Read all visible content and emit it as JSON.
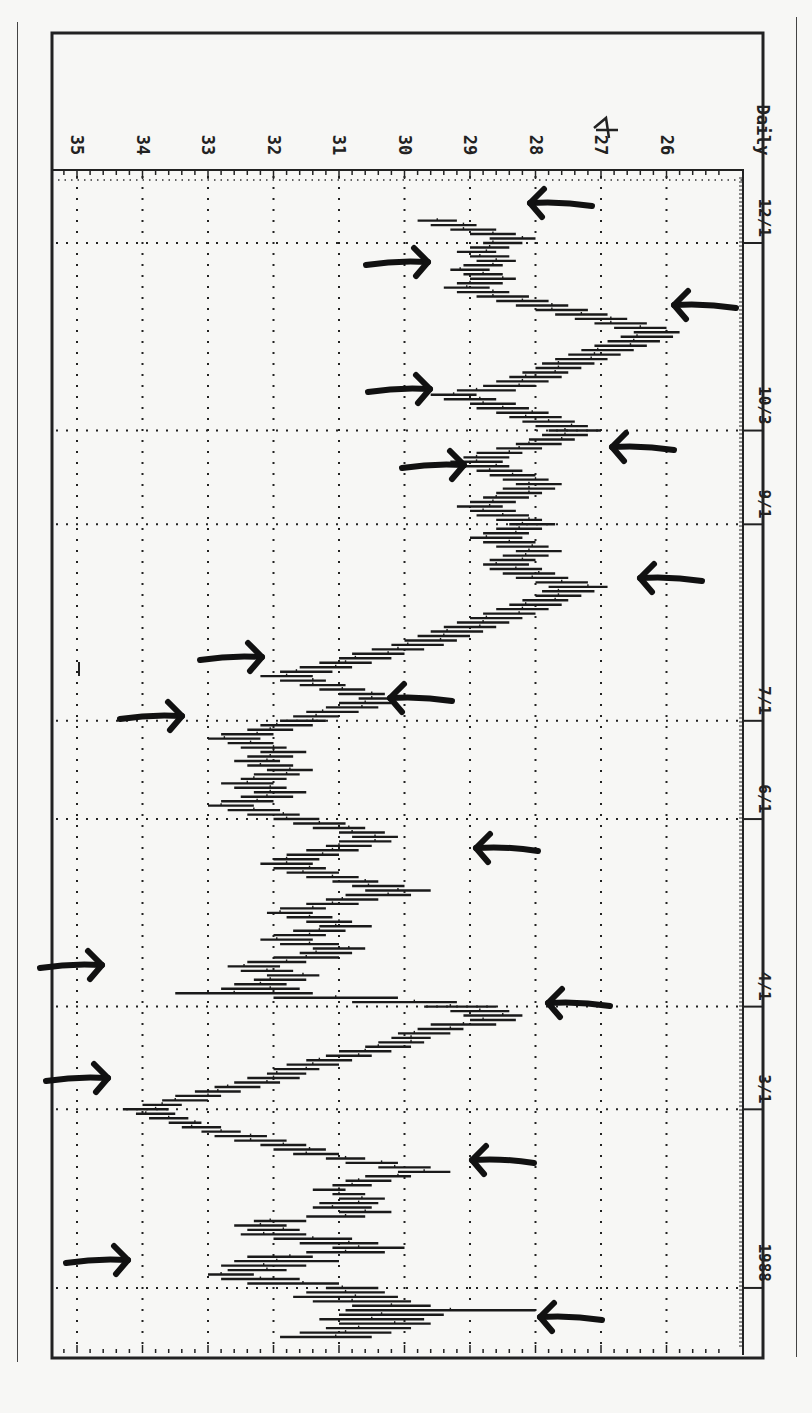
{
  "chart_data": {
    "type": "bar",
    "subtype": "ohlc-range-bars (rotated 90deg clockwise)",
    "title": "",
    "period_label": "Daily",
    "year_label": "1988",
    "ylabel": "Price",
    "xlabel": "Date",
    "price_ticks": [
      35,
      34,
      33,
      32,
      31,
      30,
      29,
      28,
      27,
      26
    ],
    "price_range": [
      25.3,
      35.3
    ],
    "date_ticks": [
      {
        "label": "1988",
        "row": 13
      },
      {
        "label": "3/1",
        "row": 53
      },
      {
        "label": "4/1",
        "row": 76
      },
      {
        "label": "6/1",
        "row": 118
      },
      {
        "label": "7/1",
        "row": 140
      },
      {
        "label": "9/1",
        "row": 184
      },
      {
        "label": "10/3",
        "row": 205
      },
      {
        "label": "12/1",
        "row": 247
      }
    ],
    "grid": true,
    "annotations": "Hand-drawn arrows marking swing highs and lows; handwritten '4' correction over the 27 tick label",
    "bars": [
      [
        30.5,
        31.9
      ],
      [
        30.2,
        31.6
      ],
      [
        29.9,
        31.2
      ],
      [
        29.6,
        31.0
      ],
      [
        29.7,
        31.3
      ],
      [
        29.4,
        31.0
      ],
      [
        28.0,
        30.9
      ],
      [
        29.6,
        30.8
      ],
      [
        29.9,
        31.4
      ],
      [
        30.1,
        31.7
      ],
      [
        30.3,
        31.5
      ],
      [
        30.4,
        31.2
      ],
      [
        31.0,
        32.4
      ],
      [
        31.6,
        32.8
      ],
      [
        32.3,
        33.0
      ],
      [
        31.8,
        32.7
      ],
      [
        31.5,
        32.8
      ],
      [
        31.0,
        32.6
      ],
      [
        31.4,
        32.4
      ],
      [
        30.3,
        31.5
      ],
      [
        30.0,
        31.1
      ],
      [
        30.4,
        31.6
      ],
      [
        30.8,
        32.0
      ],
      [
        31.5,
        32.5
      ],
      [
        31.6,
        32.4
      ],
      [
        31.8,
        32.6
      ],
      [
        31.5,
        32.3
      ],
      [
        30.6,
        31.5
      ],
      [
        30.2,
        31.0
      ],
      [
        30.5,
        31.4
      ],
      [
        30.4,
        31.3
      ],
      [
        30.3,
        31.0
      ],
      [
        30.6,
        31.1
      ],
      [
        30.9,
        31.4
      ],
      [
        30.5,
        31.1
      ],
      [
        30.2,
        30.9
      ],
      [
        29.9,
        30.6
      ],
      [
        29.3,
        30.1
      ],
      [
        29.6,
        30.4
      ],
      [
        30.1,
        30.9
      ],
      [
        30.6,
        31.2
      ],
      [
        31.0,
        31.7
      ],
      [
        31.2,
        32.0
      ],
      [
        31.5,
        32.2
      ],
      [
        31.8,
        32.6
      ],
      [
        32.1,
        32.9
      ],
      [
        32.5,
        33.1
      ],
      [
        32.8,
        33.4
      ],
      [
        33.1,
        33.6
      ],
      [
        33.3,
        33.9
      ],
      [
        33.5,
        34.1
      ],
      [
        33.6,
        34.3
      ],
      [
        33.4,
        34.0
      ],
      [
        33.0,
        33.7
      ],
      [
        32.8,
        33.5
      ],
      [
        32.5,
        33.2
      ],
      [
        32.2,
        32.9
      ],
      [
        31.9,
        32.6
      ],
      [
        31.6,
        32.4
      ],
      [
        31.5,
        32.1
      ],
      [
        31.3,
        32.0
      ],
      [
        31.0,
        31.8
      ],
      [
        30.8,
        31.5
      ],
      [
        30.5,
        31.2
      ],
      [
        30.2,
        31.0
      ],
      [
        29.9,
        30.6
      ],
      [
        29.7,
        30.4
      ],
      [
        29.6,
        30.2
      ],
      [
        29.3,
        30.1
      ],
      [
        29.1,
        29.8
      ],
      [
        28.6,
        29.6
      ],
      [
        28.3,
        29.0
      ],
      [
        28.2,
        29.1
      ],
      [
        28.4,
        29.3
      ],
      [
        28.6,
        29.7
      ],
      [
        29.2,
        30.8
      ],
      [
        30.1,
        32.0
      ],
      [
        31.4,
        33.5
      ],
      [
        31.6,
        32.8
      ],
      [
        31.8,
        32.6
      ],
      [
        31.5,
        32.3
      ],
      [
        31.3,
        32.1
      ],
      [
        31.7,
        32.5
      ],
      [
        31.9,
        32.7
      ],
      [
        31.5,
        32.4
      ],
      [
        31.0,
        32.0
      ],
      [
        30.8,
        31.6
      ],
      [
        30.6,
        31.4
      ],
      [
        31.0,
        31.9
      ],
      [
        31.4,
        32.2
      ],
      [
        31.2,
        32.0
      ],
      [
        30.9,
        31.7
      ],
      [
        30.5,
        31.3
      ],
      [
        30.8,
        31.5
      ],
      [
        31.1,
        31.8
      ],
      [
        31.4,
        32.1
      ],
      [
        31.2,
        31.9
      ],
      [
        30.7,
        31.5
      ],
      [
        30.4,
        31.2
      ],
      [
        29.9,
        30.9
      ],
      [
        29.6,
        30.6
      ],
      [
        30.0,
        30.8
      ],
      [
        30.4,
        31.1
      ],
      [
        30.7,
        31.5
      ],
      [
        31.0,
        31.8
      ],
      [
        31.2,
        32.0
      ],
      [
        31.4,
        32.2
      ],
      [
        31.3,
        32.0
      ],
      [
        31.0,
        31.8
      ],
      [
        30.7,
        31.5
      ],
      [
        30.5,
        31.2
      ],
      [
        30.2,
        31.0
      ],
      [
        30.1,
        30.8
      ],
      [
        30.3,
        31.0
      ],
      [
        30.6,
        31.4
      ],
      [
        30.9,
        31.7
      ],
      [
        31.3,
        32.0
      ],
      [
        31.6,
        32.4
      ],
      [
        31.9,
        32.7
      ],
      [
        32.3,
        33.0
      ],
      [
        32.0,
        32.8
      ],
      [
        31.7,
        32.5
      ],
      [
        31.5,
        32.3
      ],
      [
        31.8,
        32.6
      ],
      [
        32.0,
        32.8
      ],
      [
        31.8,
        32.5
      ],
      [
        31.6,
        32.3
      ],
      [
        31.4,
        32.1
      ],
      [
        31.7,
        32.4
      ],
      [
        31.9,
        32.6
      ],
      [
        31.7,
        32.4
      ],
      [
        31.5,
        32.2
      ],
      [
        31.8,
        32.5
      ],
      [
        32.0,
        32.7
      ],
      [
        32.2,
        33.0
      ],
      [
        32.0,
        32.8
      ],
      [
        31.7,
        32.4
      ],
      [
        31.4,
        32.2
      ],
      [
        31.2,
        31.9
      ],
      [
        31.0,
        31.7
      ],
      [
        30.7,
        31.5
      ],
      [
        30.4,
        31.2
      ],
      [
        30.2,
        31.0
      ],
      [
        30.0,
        30.7
      ],
      [
        30.3,
        31.0
      ],
      [
        30.6,
        31.3
      ],
      [
        30.9,
        31.6
      ],
      [
        31.2,
        31.9
      ],
      [
        31.4,
        32.2
      ],
      [
        31.1,
        31.9
      ],
      [
        30.8,
        31.6
      ],
      [
        30.5,
        31.3
      ],
      [
        30.2,
        31.0
      ],
      [
        30.0,
        30.8
      ],
      [
        29.7,
        30.5
      ],
      [
        29.4,
        30.2
      ],
      [
        29.2,
        30.0
      ],
      [
        29.0,
        29.8
      ],
      [
        28.8,
        29.6
      ],
      [
        28.6,
        29.4
      ],
      [
        28.4,
        29.2
      ],
      [
        28.2,
        29.0
      ],
      [
        28.0,
        28.8
      ],
      [
        27.8,
        28.6
      ],
      [
        27.6,
        28.4
      ],
      [
        27.5,
        28.2
      ],
      [
        27.3,
        28.0
      ],
      [
        27.1,
        27.9
      ],
      [
        26.9,
        27.8
      ],
      [
        27.2,
        28.0
      ],
      [
        27.5,
        28.3
      ],
      [
        27.7,
        28.5
      ],
      [
        27.9,
        28.7
      ],
      [
        28.1,
        28.8
      ],
      [
        28.0,
        28.7
      ],
      [
        27.8,
        28.5
      ],
      [
        27.6,
        28.3
      ],
      [
        27.8,
        28.6
      ],
      [
        28.0,
        28.8
      ],
      [
        28.2,
        29.0
      ],
      [
        28.1,
        28.8
      ],
      [
        27.9,
        28.6
      ],
      [
        27.7,
        28.4
      ],
      [
        27.9,
        28.6
      ],
      [
        28.1,
        28.9
      ],
      [
        28.3,
        29.0
      ],
      [
        28.5,
        29.2
      ],
      [
        28.3,
        29.0
      ],
      [
        28.1,
        28.8
      ],
      [
        27.9,
        28.6
      ],
      [
        27.7,
        28.5
      ],
      [
        27.6,
        28.3
      ],
      [
        27.8,
        28.5
      ],
      [
        28.0,
        28.7
      ],
      [
        28.2,
        28.9
      ],
      [
        28.4,
        29.1
      ],
      [
        28.5,
        29.3
      ],
      [
        28.4,
        29.1
      ],
      [
        28.2,
        28.9
      ],
      [
        27.9,
        28.6
      ],
      [
        27.6,
        28.3
      ],
      [
        27.4,
        28.1
      ],
      [
        27.2,
        27.9
      ],
      [
        27.0,
        27.8
      ],
      [
        27.2,
        28.0
      ],
      [
        27.4,
        28.2
      ],
      [
        27.6,
        28.4
      ],
      [
        27.8,
        28.6
      ],
      [
        28.1,
        28.9
      ],
      [
        28.3,
        29.0
      ],
      [
        28.6,
        29.4
      ],
      [
        28.9,
        29.6
      ],
      [
        28.3,
        29.2
      ],
      [
        28.0,
        28.8
      ],
      [
        27.8,
        28.6
      ],
      [
        27.6,
        28.4
      ],
      [
        27.5,
        28.2
      ],
      [
        27.3,
        28.0
      ],
      [
        27.1,
        27.9
      ],
      [
        26.9,
        27.7
      ],
      [
        26.7,
        27.5
      ],
      [
        26.5,
        27.3
      ],
      [
        26.3,
        27.1
      ],
      [
        26.1,
        26.9
      ],
      [
        25.9,
        26.7
      ],
      [
        25.8,
        26.5
      ],
      [
        26.0,
        26.8
      ],
      [
        26.3,
        27.1
      ],
      [
        26.6,
        27.4
      ],
      [
        26.9,
        27.7
      ],
      [
        27.2,
        28.0
      ],
      [
        27.5,
        28.3
      ],
      [
        27.8,
        28.6
      ],
      [
        28.1,
        28.9
      ],
      [
        28.4,
        29.2
      ],
      [
        28.7,
        29.4
      ],
      [
        28.5,
        29.2
      ],
      [
        28.3,
        29.0
      ],
      [
        28.5,
        29.1
      ],
      [
        28.7,
        29.3
      ],
      [
        28.5,
        29.1
      ],
      [
        28.3,
        28.9
      ],
      [
        28.4,
        29.0
      ],
      [
        28.6,
        29.2
      ],
      [
        28.4,
        29.0
      ],
      [
        28.2,
        28.8
      ],
      [
        28.0,
        28.7
      ],
      [
        28.3,
        29.0
      ],
      [
        28.6,
        29.3
      ],
      [
        28.9,
        29.6
      ],
      [
        29.2,
        29.8
      ]
    ]
  },
  "page": {
    "left_rule": true,
    "right_rule": true
  }
}
